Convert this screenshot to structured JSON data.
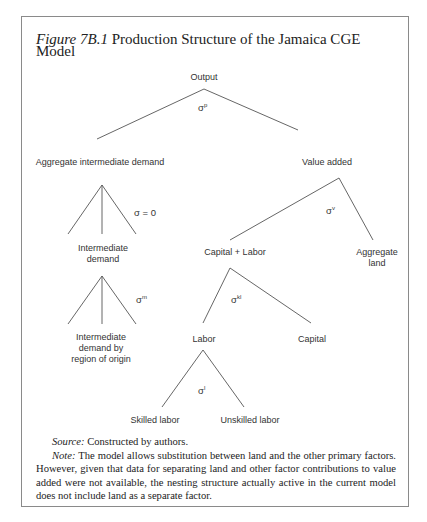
{
  "figure": {
    "label": "Figure 7B.1",
    "title": " Production Structure of the Jamaica CGE Model"
  },
  "nodes": {
    "output": "Output",
    "aggregate_intermediate_demand": "Aggregate intermediate demand",
    "value_added": "Value added",
    "intermediate_demand_line1": "Intermediate",
    "intermediate_demand_line2": "demand",
    "capital_labor": "Capital + Labor",
    "aggregate_land_line1": "Aggregate",
    "aggregate_land_line2": "land",
    "intermediate_by_region_line1": "Intermediate",
    "intermediate_by_region_line2": "demand by",
    "intermediate_by_region_line3": "region of origin",
    "labor": "Labor",
    "capital": "Capital",
    "skilled_labor": "Skilled labor",
    "unskilled_labor": "Unskilled labor"
  },
  "elasticities": {
    "output": {
      "base": "σ",
      "sup": "p"
    },
    "intermediate": {
      "text": "σ = 0"
    },
    "value_added": {
      "base": "σ",
      "sup": "v"
    },
    "region": {
      "base": "σ",
      "sup": "m"
    },
    "capital_labor": {
      "base": "σ",
      "sup": "kl"
    },
    "labor": {
      "base": "σ",
      "sup": "l"
    }
  },
  "notes": {
    "source_label": "Source:",
    "source_text": " Constructed by authors.",
    "note_label": "Note:",
    "note_text": " The model allows substitution between land and the other primary factors. However, given that data for separating land and other factor contributions to value added were not available, the nesting structure actually active in the current model does not include land as a separate factor."
  }
}
